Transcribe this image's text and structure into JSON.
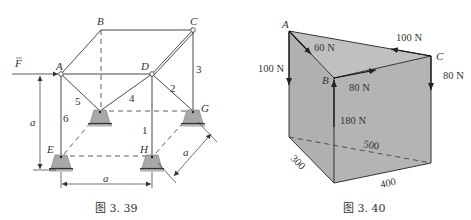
{
  "figure_left": {
    "caption": "图 3. 39",
    "node_labels": {
      "A": "A",
      "B": "B",
      "C": "C",
      "D": "D",
      "E": "E",
      "G": "G",
      "H": "H"
    },
    "force_label": "F",
    "member_labels": [
      "1",
      "2",
      "3",
      "4",
      "5",
      "6"
    ],
    "dimension_labels": {
      "height": "a",
      "width": "a",
      "depth": "a"
    },
    "colors": {
      "line": "#333333",
      "support_fill": "#a8a8a8",
      "ground": "#555555"
    }
  },
  "figure_right": {
    "caption": "图 3. 40",
    "node_labels": {
      "A": "A",
      "B": "B",
      "C": "C"
    },
    "forces": {
      "A_down": "100 N",
      "AB": "60 N",
      "CA": "100 N",
      "BC": "80 N",
      "C_down": "80 N",
      "B_up": "180 N"
    },
    "dimensions": {
      "diagonal": "500",
      "depth": "300",
      "width": "400"
    },
    "colors": {
      "prism_fill": "#b4b4b4",
      "top_fill": "#c2c2c2",
      "edge": "#222222"
    }
  }
}
